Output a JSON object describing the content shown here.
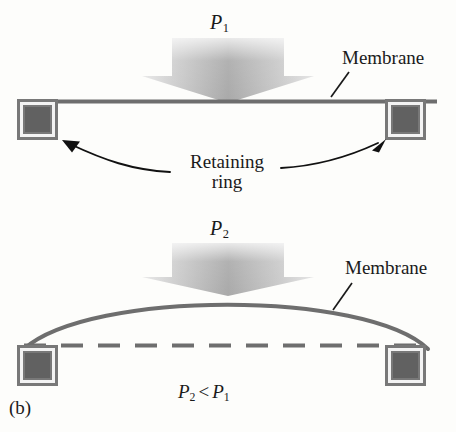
{
  "figure": {
    "panel_label": "(b)",
    "background_color": "#fdfdfb",
    "ink_color": "#1a1a1a",
    "structure_color": "#6e6e6e",
    "ring_fill_color": "#666666",
    "ring_inner_border_color": "#f2f2f2",
    "arrow_gradient_light": "#dedede",
    "arrow_gradient_dark": "#9a9a9a"
  },
  "diagram_top": {
    "pressure_label": "P",
    "pressure_subscript": "1",
    "membrane_label": "Membrane",
    "retaining_label_line1": "Retaining",
    "retaining_label_line2": "ring",
    "membrane_state": "flat",
    "arrow_name": "downward-pressure-arrow"
  },
  "diagram_bottom": {
    "pressure_label": "P",
    "pressure_subscript": "2",
    "membrane_label": "Membrane",
    "membrane_state": "bowed-upward",
    "reference_line_style": "dashed",
    "inequality": {
      "left_symbol": "P",
      "left_subscript": "2",
      "operator": "<",
      "right_symbol": "P",
      "right_subscript": "1"
    },
    "arrow_name": "downward-pressure-arrow"
  },
  "geometry": {
    "top_membrane_y": 101,
    "bottom_dashed_y": 345,
    "bottom_arc_apex_y": 292,
    "left_ring_x": 17,
    "right_ring_x": 385,
    "ring_size": 41
  }
}
